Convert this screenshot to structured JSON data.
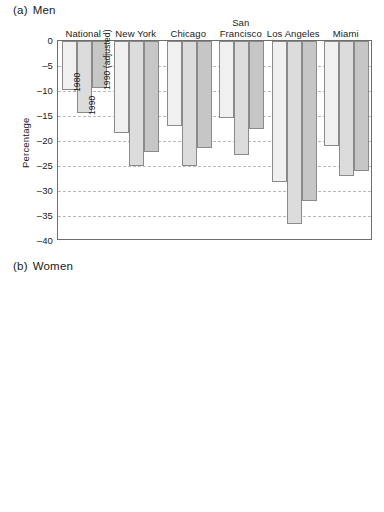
{
  "figure": {
    "panels": [
      {
        "tag": "(a)",
        "title": "Men"
      },
      {
        "tag": "(b)",
        "title": "Women"
      }
    ]
  },
  "axis": {
    "ylabel": "Percentage",
    "yticks": [
      "0",
      "–5",
      "–10",
      "–15",
      "–20",
      "–25",
      "–30",
      "–35",
      "–40"
    ]
  },
  "series_notes": [
    {
      "text": "1980"
    },
    {
      "text": "1990"
    },
    {
      "text": "1990 (adjusted)"
    }
  ],
  "categories": [
    {
      "line1": "National",
      "line2": ""
    },
    {
      "line1": "New York",
      "line2": ""
    },
    {
      "line1": "Chicago",
      "line2": ""
    },
    {
      "line1": "San",
      "line2": "Francisco"
    },
    {
      "line1": "Los Angeles",
      "line2": ""
    },
    {
      "line1": "Miami",
      "line2": ""
    }
  ],
  "colors": {
    "series_1980": "#f0f0f0",
    "series_1990": "#dcdcdc",
    "series_1990_adjusted": "#c6c6c6",
    "bar_outline": "#8a8a8a",
    "gridline": "#b9b9b9",
    "frame": "#6e6e6e",
    "text": "#1a1a1a"
  },
  "chart_data": [
    {
      "type": "bar",
      "title": "(a) Men",
      "xlabel": "",
      "ylabel": "Percentage",
      "ylim": [
        -40,
        0
      ],
      "ytick_step": 5,
      "grid": true,
      "legend": "inline rotated labels at first group",
      "categories": [
        "National",
        "New York",
        "Chicago",
        "San Francisco",
        "Los Angeles",
        "Miami"
      ],
      "series": [
        {
          "name": "1980",
          "values": [
            -9.8,
            -18.4,
            -17.0,
            -15.4,
            -28.2,
            -21.0
          ]
        },
        {
          "name": "1990",
          "values": [
            -14.3,
            -25.0,
            -24.9,
            -22.7,
            -36.6,
            -26.9
          ]
        },
        {
          "name": "1990 (adjusted)",
          "values": [
            -9.3,
            -22.2,
            -21.3,
            -17.5,
            -31.9,
            -26.0
          ]
        }
      ]
    },
    {
      "type": "bar",
      "title": "(b) Women",
      "xlabel": "",
      "ylabel": "Percentage",
      "ylim": [
        -40,
        0
      ],
      "ytick_step": 5,
      "grid": true,
      "legend": "shared with panel (a)",
      "categories": [
        "National",
        "New York",
        "Chicago",
        "San Francisco",
        "Los Angeles",
        "Miami"
      ],
      "series": [
        {
          "name": "1980",
          "values": [
            -1.2,
            -13.9,
            -4.7,
            -8.9,
            -20.8,
            -18.0
          ]
        },
        {
          "name": "1990",
          "values": [
            -4.2,
            -19.6,
            -15.0,
            -17.3,
            -27.9,
            -21.9
          ]
        },
        {
          "name": "1990 (adjusted)",
          "values": [
            -2.2,
            -17.9,
            -13.3,
            -15.4,
            -23.0,
            -21.2
          ]
        }
      ]
    }
  ]
}
